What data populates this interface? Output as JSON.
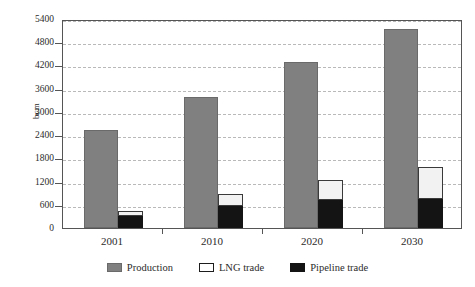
{
  "chart_data": {
    "type": "bar",
    "title": "",
    "subtitle": "",
    "xlabel": "",
    "ylabel": "bcm",
    "categories": [
      "2001",
      "2010",
      "2020",
      "2030"
    ],
    "ylim": [
      0,
      5400
    ],
    "yticks": [
      0,
      600,
      1200,
      1800,
      2400,
      3000,
      3600,
      4200,
      4800,
      5400
    ],
    "ytick_labels": [
      "0",
      "600",
      "1200",
      "1800",
      "2400",
      "3000",
      "3600",
      "4200",
      "4800",
      "5400"
    ],
    "grid": true,
    "grid_style": "dashed-horizontal",
    "legend_position": "bottom-center",
    "stacking": "Pipeline trade and LNG trade are stacked in a second bar beside Production",
    "series": [
      {
        "name": "Production",
        "kind": "grouped",
        "color": "#808080",
        "values": [
          2530,
          3380,
          4280,
          5150
        ]
      },
      {
        "name": "LNG trade",
        "kind": "stacked-top",
        "color": "#f2f2f2",
        "values": [
          140,
          330,
          530,
          830
        ]
      },
      {
        "name": "Pipeline trade",
        "kind": "stacked-bottom",
        "color": "#141414",
        "values": [
          300,
          560,
          720,
          740
        ]
      }
    ],
    "stack_totals": [
      440,
      890,
      1250,
      1570
    ]
  },
  "axis": {
    "y_title": "bcm"
  },
  "legend": {
    "items": [
      {
        "label": "Production",
        "swatch": "production-swatch"
      },
      {
        "label": "LNG trade",
        "swatch": "lng-swatch"
      },
      {
        "label": "Pipeline trade",
        "swatch": "pipeline-swatch"
      }
    ]
  },
  "colors": {
    "production": "#808080",
    "lng": "#f2f2f2",
    "pipeline": "#141414",
    "grid": "#b9b9b9",
    "frame": "#555555",
    "text": "#2b2b2b",
    "background": "#ffffff"
  }
}
